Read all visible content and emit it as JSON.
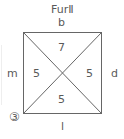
{
  "title": "FurⅡ",
  "sides": {
    "top": "b",
    "left": "m",
    "right": "d",
    "bottom": "l"
  },
  "regions": {
    "top": "7",
    "left": "5",
    "right": "5",
    "bottom": "5"
  },
  "corner_marker": "③",
  "colors": {
    "line": "#666666",
    "text": "#5a5a5a"
  }
}
